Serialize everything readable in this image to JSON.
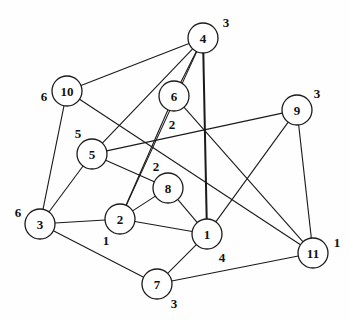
{
  "diagram": {
    "background_color": "#fefefe",
    "stroke_color": "#1a1a1a",
    "node_fill": "#ffffff"
  },
  "nodes": [
    {
      "id": "4",
      "label": "4",
      "cx": 203,
      "cy": 38,
      "r": 15,
      "weight": "3",
      "wx": 226,
      "wy": 22
    },
    {
      "id": "10",
      "label": "10",
      "cx": 67,
      "cy": 91,
      "r": 15,
      "weight": "6",
      "wx": 44,
      "wy": 96
    },
    {
      "id": "6",
      "label": "6",
      "cx": 174,
      "cy": 96,
      "r": 15,
      "weight": "2",
      "wx": 172,
      "wy": 124
    },
    {
      "id": "9",
      "label": "9",
      "cx": 297,
      "cy": 110,
      "r": 15,
      "weight": "3",
      "wx": 317,
      "wy": 93
    },
    {
      "id": "5",
      "label": "5",
      "cx": 92,
      "cy": 154,
      "r": 15,
      "weight": "5",
      "wx": 78,
      "wy": 133
    },
    {
      "id": "8",
      "label": "8",
      "cx": 168,
      "cy": 188,
      "r": 15,
      "weight": "2",
      "wx": 156,
      "wy": 166
    },
    {
      "id": "3",
      "label": "3",
      "cx": 40,
      "cy": 224,
      "r": 15,
      "weight": "6",
      "wx": 18,
      "wy": 212
    },
    {
      "id": "2",
      "label": "2",
      "cx": 120,
      "cy": 219,
      "r": 15,
      "weight": "1",
      "wx": 106,
      "wy": 240
    },
    {
      "id": "1",
      "label": "1",
      "cx": 207,
      "cy": 234,
      "r": 15,
      "weight": "4",
      "wx": 222,
      "wy": 257
    },
    {
      "id": "11",
      "label": "11",
      "cx": 313,
      "cy": 253,
      "r": 15,
      "weight": "1",
      "wx": 337,
      "wy": 242
    },
    {
      "id": "7",
      "label": "7",
      "cx": 157,
      "cy": 284,
      "r": 15,
      "weight": "3",
      "wx": 174,
      "wy": 303
    }
  ],
  "edges": [
    {
      "from": "4",
      "to": "10",
      "thick": false
    },
    {
      "from": "4",
      "to": "6",
      "thick": false
    },
    {
      "from": "4",
      "to": "1",
      "thick": true
    },
    {
      "from": "4",
      "to": "2",
      "thick": false
    },
    {
      "from": "4",
      "to": "5",
      "thick": false
    },
    {
      "from": "10",
      "to": "3",
      "thick": false
    },
    {
      "from": "10",
      "to": "11",
      "thick": false
    },
    {
      "from": "6",
      "to": "11",
      "thick": false
    },
    {
      "from": "6",
      "to": "2",
      "thick": false
    },
    {
      "from": "9",
      "to": "5",
      "thick": false
    },
    {
      "from": "9",
      "to": "1",
      "thick": false
    },
    {
      "from": "9",
      "to": "11",
      "thick": false
    },
    {
      "from": "5",
      "to": "3",
      "thick": false
    },
    {
      "from": "5",
      "to": "8",
      "thick": false
    },
    {
      "from": "8",
      "to": "2",
      "thick": false
    },
    {
      "from": "8",
      "to": "1",
      "thick": false
    },
    {
      "from": "3",
      "to": "2",
      "thick": false
    },
    {
      "from": "3",
      "to": "7",
      "thick": false
    },
    {
      "from": "2",
      "to": "1",
      "thick": false
    },
    {
      "from": "1",
      "to": "7",
      "thick": false
    },
    {
      "from": "7",
      "to": "11",
      "thick": false
    }
  ]
}
